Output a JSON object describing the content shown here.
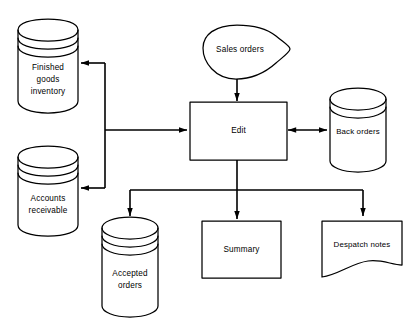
{
  "diagram": {
    "stroke_color": "#000000",
    "fill_color": "#ffffff",
    "nodes": {
      "sales_orders": {
        "label": "Sales orders",
        "shape": "cloud"
      },
      "edit": {
        "label": "Edit",
        "shape": "rectangle"
      },
      "back_orders": {
        "label": "Back orders",
        "shape": "cylinder"
      },
      "finished_goods": {
        "label_line1": "Finished",
        "label_line2": "goods",
        "label_line3": "inventory",
        "shape": "cylinder"
      },
      "accounts_receivable": {
        "label_line1": "Accounts",
        "label_line2": "receivable",
        "shape": "cylinder"
      },
      "accepted_orders": {
        "label_line1": "Accepted",
        "label_line2": "orders",
        "shape": "cylinder"
      },
      "summary": {
        "label": "Summary",
        "shape": "rectangle"
      },
      "despatch_notes": {
        "label": "Despatch notes",
        "shape": "document"
      }
    },
    "edges": [
      {
        "from": "sales_orders",
        "to": "edit",
        "arrow": "single"
      },
      {
        "from": "edit",
        "to": "back_orders",
        "arrow": "double"
      },
      {
        "from": "edit",
        "to": "finished_goods",
        "arrow": "single"
      },
      {
        "from": "edit",
        "to": "accounts_receivable",
        "arrow": "single"
      },
      {
        "from": "edit",
        "to": "accepted_orders",
        "arrow": "single"
      },
      {
        "from": "edit",
        "to": "summary",
        "arrow": "single"
      },
      {
        "from": "edit",
        "to": "despatch_notes",
        "arrow": "single"
      }
    ]
  }
}
